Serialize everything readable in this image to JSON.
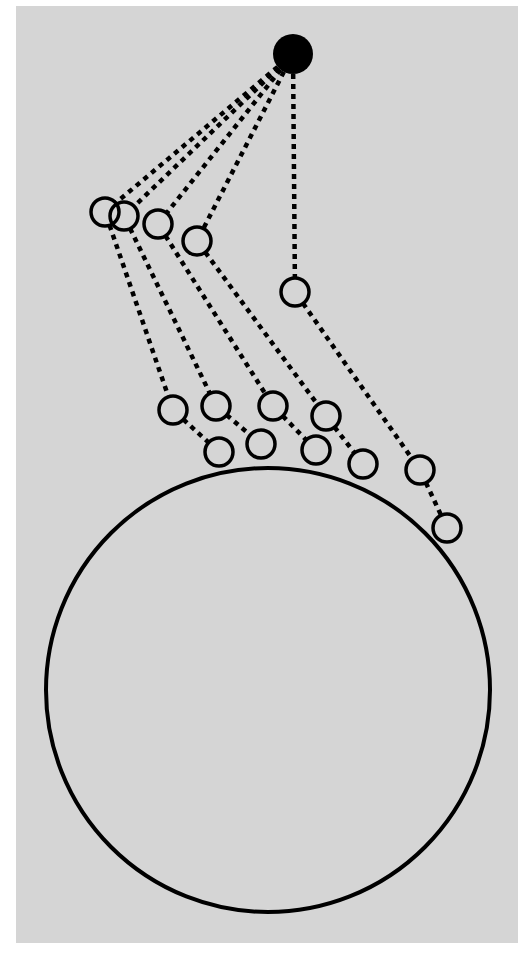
{
  "diagram": {
    "title": "",
    "panel": {
      "x": 16,
      "y": 6,
      "width": 502,
      "height": 937,
      "color": "#d5d5d5"
    },
    "colors": {
      "stroke": "#000000",
      "background": "#ffffff"
    },
    "anchor": {
      "label": "",
      "x": 293,
      "y": 54,
      "r": 20
    },
    "body": {
      "label": "",
      "cx": 268,
      "cy": 690,
      "r": 222
    },
    "node_radius": 14,
    "chains": [
      {
        "id": "A",
        "nodes": [
          {
            "x": 105,
            "y": 212
          },
          {
            "x": 173,
            "y": 410
          },
          {
            "x": 219,
            "y": 452
          }
        ]
      },
      {
        "id": "B",
        "nodes": [
          {
            "x": 124,
            "y": 216
          },
          {
            "x": 216,
            "y": 406
          },
          {
            "x": 261,
            "y": 444
          }
        ]
      },
      {
        "id": "C",
        "nodes": [
          {
            "x": 158,
            "y": 224
          },
          {
            "x": 273,
            "y": 406
          },
          {
            "x": 316,
            "y": 450
          }
        ]
      },
      {
        "id": "D",
        "nodes": [
          {
            "x": 197,
            "y": 241
          },
          {
            "x": 326,
            "y": 416
          },
          {
            "x": 363,
            "y": 464
          }
        ]
      },
      {
        "id": "E",
        "nodes": [
          {
            "x": 295,
            "y": 292
          },
          {
            "x": 420,
            "y": 470
          },
          {
            "x": 447,
            "y": 528
          }
        ]
      }
    ]
  }
}
